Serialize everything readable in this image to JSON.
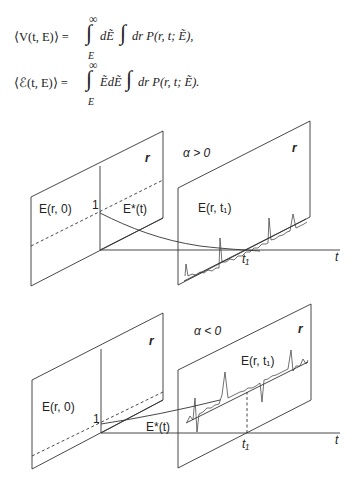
{
  "equations": [
    {
      "lhs": "⟨V(t, E)⟩ =",
      "upper_limit": "∞",
      "lower_limit": "E",
      "integrand1": "dẼ",
      "integrand2": "dr P(r, t; Ẽ),"
    },
    {
      "lhs": "⟨ℰ(t, E)⟩ =",
      "upper_limit": "∞",
      "lower_limit": "E",
      "integrand1": "ẼdẼ",
      "integrand2": "dr P(r, t; Ẽ)."
    }
  ],
  "panels": [
    {
      "condition": "α > 0",
      "initial_plane_label": "E(r, 0)",
      "plane_axis": "r",
      "final_plane_label": "E(r, t₁)",
      "final_plane_axis": "r",
      "curve_label": "E*(t)",
      "value_mark": "1",
      "time_axis": "t",
      "time_mark": "t₁",
      "curve_trend": "decreasing"
    },
    {
      "condition": "α < 0",
      "initial_plane_label": "E(r, 0)",
      "plane_axis": "r",
      "final_plane_label": "E(r, t₁)",
      "final_plane_axis": "r",
      "curve_label": "E*(t)",
      "value_mark": "1",
      "time_axis": "t",
      "time_mark": "t₁",
      "curve_trend": "increasing"
    }
  ]
}
